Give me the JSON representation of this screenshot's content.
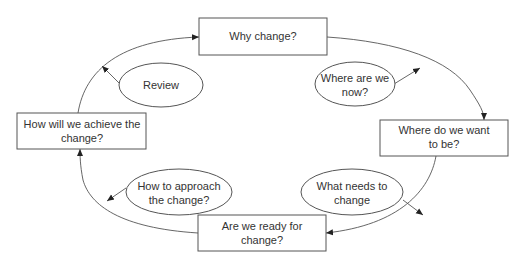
{
  "diagram": {
    "boxes": [
      {
        "id": "why-change",
        "lines": [
          "Why change?"
        ]
      },
      {
        "id": "where-want-to-be",
        "lines": [
          "Where do we want",
          "to be?"
        ]
      },
      {
        "id": "ready-for-change",
        "lines": [
          "Are we ready for",
          "change?"
        ]
      },
      {
        "id": "how-achieve",
        "lines": [
          "How will we achieve the",
          "change?"
        ]
      }
    ],
    "ellipses": [
      {
        "id": "where-now",
        "lines": [
          "Where are we",
          "now?"
        ]
      },
      {
        "id": "what-needs",
        "lines": [
          "What needs to",
          "change"
        ]
      },
      {
        "id": "how-approach",
        "lines": [
          "How to approach",
          "the change?"
        ]
      },
      {
        "id": "review",
        "lines": [
          "Review"
        ]
      }
    ],
    "colors": {
      "stroke": "#555555",
      "text": "#333333",
      "background": "#ffffff"
    }
  }
}
